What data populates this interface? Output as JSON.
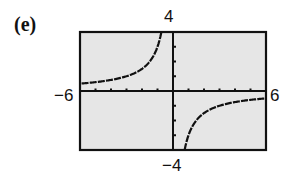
{
  "panel_label": "(e)",
  "chart_data": {
    "type": "line",
    "title": "",
    "xlabel": "",
    "ylabel": "",
    "xlim": [
      -6,
      6
    ],
    "ylim": [
      -4,
      4
    ],
    "x_tick_step": 1,
    "y_tick_step": 1,
    "grid": false,
    "legend": null,
    "axis_labels": {
      "xmin": "−6",
      "xmax": "6",
      "ymin": "−4",
      "ymax": "4"
    },
    "function": "y = -3/x",
    "vertical_asymptote": 0,
    "horizontal_asymptote": 0,
    "series": [
      {
        "name": "left branch",
        "x": [
          -6,
          -5,
          -4,
          -3,
          -2,
          -1.5,
          -1,
          -0.75
        ],
        "y": [
          0.5,
          0.6,
          0.75,
          1.0,
          1.5,
          2.0,
          3.0,
          4.0
        ]
      },
      {
        "name": "right branch",
        "x": [
          0.75,
          1,
          1.5,
          2,
          3,
          4,
          5,
          6
        ],
        "y": [
          -4.0,
          -3.0,
          -2.0,
          -1.5,
          -1.0,
          -0.75,
          -0.6,
          -0.5
        ]
      }
    ],
    "colors": {
      "background": "#e6e6e6",
      "frame": "#111111",
      "curve": "#111111"
    }
  }
}
